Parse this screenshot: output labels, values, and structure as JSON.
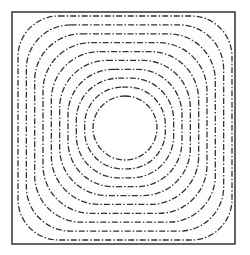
{
  "figure": {
    "frame": {
      "x": 12,
      "y": 12,
      "width": 223,
      "height": 232,
      "stroke": "#333333",
      "stroke_width": 1.5
    },
    "center": {
      "x": 125,
      "y": 128
    },
    "contours": {
      "count": 10,
      "stroke": "#333333",
      "stroke_width": 1.3,
      "dasharray": "6 2 1.5 2",
      "inner_radius": 32,
      "outer_half_width": 107,
      "outer_half_height": 112
    }
  }
}
